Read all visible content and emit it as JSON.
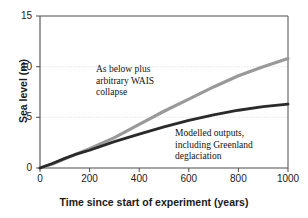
{
  "chart_data": {
    "type": "line",
    "title": "",
    "xlabel": "Time since start of experiment (years)",
    "ylabel": "Sea level (m)",
    "xlim": [
      0,
      1000
    ],
    "ylim": [
      0,
      15
    ],
    "xticks": [
      0,
      200,
      400,
      600,
      800,
      1000
    ],
    "yticks": [
      0,
      5,
      10,
      15
    ],
    "xtick_labels": [
      "0",
      "200",
      "400",
      "600",
      "800",
      "1000"
    ],
    "ytick_labels": [
      "0",
      "5",
      "10",
      "15"
    ],
    "grid": "horizontal dotted gridlines at y = 5 and y = 10",
    "legend": "none; series labelled by in-plot annotations",
    "series": [
      {
        "name": "As below plus arbitrary WAIS collapse",
        "color": "#999999",
        "x": [
          0,
          50,
          100,
          150,
          200,
          300,
          400,
          500,
          600,
          700,
          800,
          900,
          1000
        ],
        "values": [
          0.0,
          0.4,
          0.9,
          1.4,
          1.9,
          3.0,
          4.3,
          5.6,
          6.8,
          8.0,
          9.1,
          10.0,
          10.8
        ]
      },
      {
        "name": "Modelled outputs, including Greenland deglaciation",
        "color": "#2a2a2a",
        "x": [
          0,
          50,
          100,
          150,
          200,
          300,
          400,
          500,
          600,
          700,
          800,
          900,
          1000
        ],
        "values": [
          0.0,
          0.45,
          0.95,
          1.4,
          1.75,
          2.6,
          3.35,
          4.05,
          4.7,
          5.25,
          5.7,
          6.05,
          6.3
        ]
      }
    ],
    "annotations": [
      {
        "id": "gray-series-label",
        "lines": [
          "As below plus",
          "arbitrary WAIS",
          "collapse"
        ],
        "refers_to": "As below plus arbitrary WAIS collapse"
      },
      {
        "id": "dark-series-label",
        "lines": [
          "Modelled outputs,",
          "including Greenland",
          "deglaciation"
        ],
        "refers_to": "Modelled outputs, including Greenland deglaciation"
      }
    ]
  },
  "axes": {
    "xlabel": "Time since start of experiment (years)",
    "ylabel": "Sea level (m)",
    "xticks": [
      "0",
      "200",
      "400",
      "600",
      "800",
      "1000"
    ],
    "yticks": [
      "15",
      "10",
      "5",
      "0"
    ]
  },
  "annotations": {
    "gray": {
      "line1": "As below plus",
      "line2": "arbitrary WAIS",
      "line3": "collapse"
    },
    "dark": {
      "line1": "Modelled outputs,",
      "line2": "including Greenland",
      "line3": "deglaciation"
    }
  },
  "colors": {
    "gray_series": "#999999",
    "dark_series": "#2a2a2a",
    "axis": "#4d4d4d",
    "grid": "#d8d8d8",
    "text": "#1a1a1a",
    "background": "#ffffff"
  }
}
